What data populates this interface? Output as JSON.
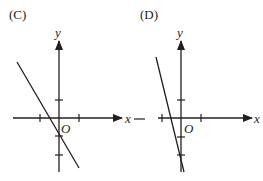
{
  "panels": [
    {
      "label": "(C)",
      "x_axis_label": "x",
      "y_axis_label": "y",
      "origin_label": "O",
      "description": "Line with negative slope crossing negative x-axis near -0.6 and y-axis at -1"
    },
    {
      "label": "(D)",
      "x_axis_label": "x",
      "y_axis_label": "y",
      "origin_label": "O",
      "description": "Steep line with negative slope crossing negative x-axis near -0.5 and y-axis at -2"
    }
  ],
  "separator": "-",
  "colors": {
    "ink": "#231f20",
    "background": "#ffffff"
  }
}
